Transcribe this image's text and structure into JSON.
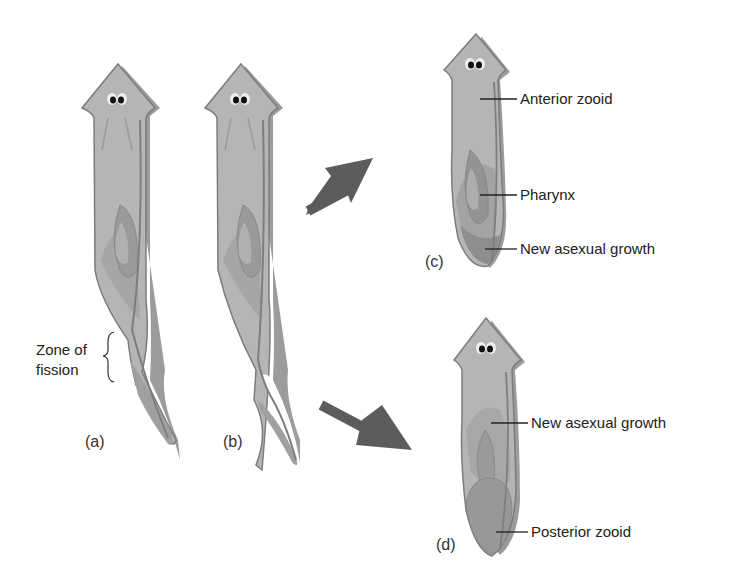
{
  "figure": {
    "colors": {
      "body_light": "#b9b9b9",
      "body_mid": "#a3a3a3",
      "body_dark": "#8c8c8c",
      "outline": "#7a7a7a",
      "arrow": "#5c5c5c",
      "text": "#222222"
    },
    "panels": [
      {
        "id": "a",
        "label": "(a)"
      },
      {
        "id": "b",
        "label": "(b)"
      },
      {
        "id": "c",
        "label": "(c)"
      },
      {
        "id": "d",
        "label": "(d)"
      }
    ],
    "annotations": {
      "zone_of_fission": {
        "line1": "Zone of",
        "line2": "fission"
      },
      "c": {
        "anterior_zooid": "Anterior zooid",
        "pharynx": "Pharynx",
        "new_asexual_growth": "New asexual growth"
      },
      "d": {
        "new_asexual_growth": "New asexual growth",
        "posterior_zooid": "Posterior zooid"
      }
    },
    "arrows": [
      {
        "from": "b",
        "to": "c",
        "direction": "up-right"
      },
      {
        "from": "b",
        "to": "d",
        "direction": "down-right"
      }
    ]
  }
}
